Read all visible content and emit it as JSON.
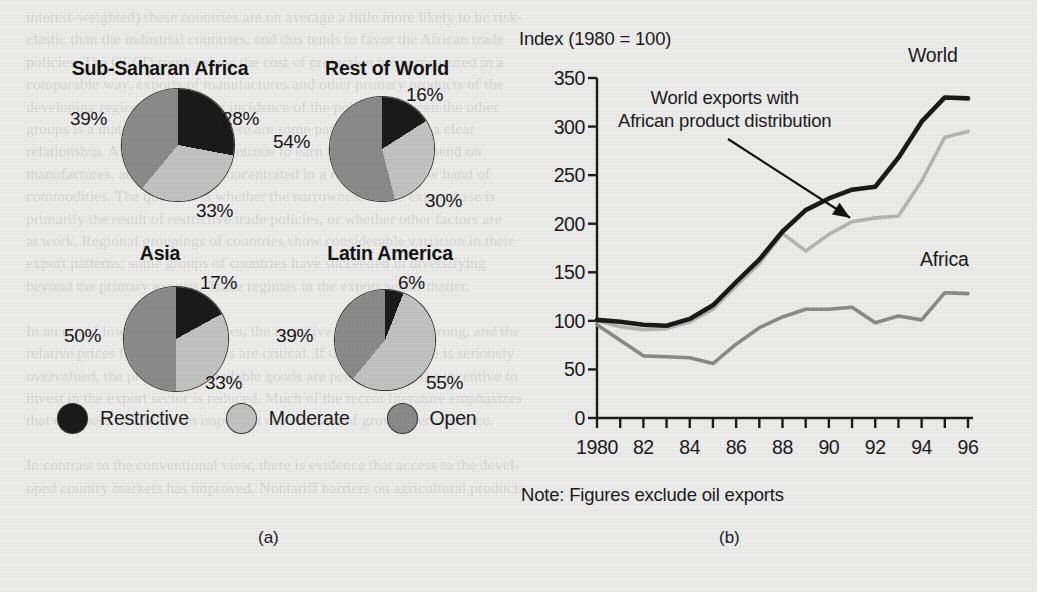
{
  "figure": {
    "panel_a_caption": "(a)",
    "panel_b_caption": "(b)"
  },
  "panel_a": {
    "name": "trade-policy-pie-charts",
    "legend": [
      {
        "label": "Restrictive",
        "color": "#1a1a1a",
        "key": "restrictive"
      },
      {
        "label": "Moderate",
        "color": "#c2c2c2",
        "key": "moderate"
      },
      {
        "label": "Open",
        "color": "#8a8a8a",
        "key": "open"
      }
    ],
    "pies": [
      {
        "title": "Sub-Saharan Africa",
        "slices": [
          {
            "key": "restrictive",
            "label": "28%",
            "value": 28
          },
          {
            "key": "moderate",
            "label": "33%",
            "value": 33
          },
          {
            "key": "open",
            "label": "39%",
            "value": 39
          }
        ]
      },
      {
        "title": "Rest of World",
        "slices": [
          {
            "key": "restrictive",
            "label": "16%",
            "value": 16
          },
          {
            "key": "moderate",
            "label": "30%",
            "value": 30
          },
          {
            "key": "open",
            "label": "54%",
            "value": 54
          }
        ]
      },
      {
        "title": "Asia",
        "slices": [
          {
            "key": "restrictive",
            "label": "17%",
            "value": 17
          },
          {
            "key": "moderate",
            "label": "33%",
            "value": 33
          },
          {
            "key": "open",
            "label": "50%",
            "value": 50
          }
        ]
      },
      {
        "title": "Latin America",
        "slices": [
          {
            "key": "restrictive",
            "label": "6%",
            "value": 6
          },
          {
            "key": "moderate",
            "label": "55%",
            "value": 55
          },
          {
            "key": "open",
            "label": "39%",
            "value": 39
          }
        ]
      }
    ]
  },
  "panel_b": {
    "name": "export-index-line-chart",
    "axis_title": "Index (1980 = 100)",
    "note": "Note: Figures exclude oil exports",
    "annotation": {
      "line1": "World exports with",
      "line2": "African product distribution"
    },
    "series_labels": {
      "world": "World",
      "africa": "Africa"
    }
  },
  "chart_data": {
    "type": "line",
    "title": "Index (1980 = 100)",
    "xlabel": "",
    "ylabel": "Index (1980 = 100)",
    "xlim": [
      1980,
      1996
    ],
    "ylim": [
      0,
      350
    ],
    "yticks": [
      0,
      50,
      100,
      150,
      200,
      250,
      300,
      350
    ],
    "xticks": [
      1980,
      1981,
      1982,
      1983,
      1984,
      1985,
      1986,
      1987,
      1988,
      1989,
      1990,
      1991,
      1992,
      1993,
      1994,
      1995,
      1996
    ],
    "xticklabels": [
      "1980",
      "",
      "82",
      "",
      "84",
      "",
      "86",
      "",
      "88",
      "",
      "90",
      "",
      "92",
      "",
      "94",
      "",
      "96"
    ],
    "grid": false,
    "legend_position": "inline-labels",
    "x": [
      1980,
      1981,
      1982,
      1983,
      1984,
      1985,
      1986,
      1987,
      1988,
      1989,
      1990,
      1991,
      1992,
      1993,
      1994,
      1995,
      1996
    ],
    "series": [
      {
        "name": "World",
        "color": "#1a1a1a",
        "values": [
          101,
          99,
          96,
          95,
          102,
          116,
          140,
          163,
          192,
          214,
          226,
          235,
          238,
          268,
          305,
          330,
          329
        ]
      },
      {
        "name": "World exports with African product distribution",
        "color": "#b4b4b4",
        "values": [
          100,
          94,
          91,
          92,
          99,
          112,
          136,
          159,
          190,
          172,
          189,
          202,
          206,
          208,
          244,
          289,
          295
        ]
      },
      {
        "name": "Africa",
        "color": "#8a8a8a",
        "values": [
          96,
          80,
          64,
          63,
          62,
          56,
          76,
          93,
          104,
          112,
          112,
          114,
          98,
          105,
          101,
          129,
          128
        ]
      }
    ],
    "annotations": [
      {
        "text": "World exports with African product distribution",
        "points_to_series": "World exports with African product distribution",
        "points_to_x": 1991
      },
      {
        "text": "World",
        "series": "World"
      },
      {
        "text": "Africa",
        "series": "Africa"
      }
    ],
    "note": "Note: Figures exclude oil exports"
  },
  "background_text": {
    "lines": [
      "interest-weighted) these countries are on average a little more likely to be risk-",
      "elastic than the industrial countries, and this tends to favor the African trade",
      "policies. The OECD results show the cost of protection being measured in a",
      "comparable way, exports of manufactures and other primary products of the",
      "developing regions; the relative incidence of the policies between the other",
      "groups is a matter of interest. There are some patterns that show a clear",
      "relationship. African countries continue to earn more than they spend on",
      "manufactures, and exports are concentrated in a relatively narrow band of",
      "commodities. The question is whether the narrowness of the export base is",
      "primarily the result of restrictive trade policies, or whether other factors are",
      "at work. Regional groupings of countries show considerable variation in their",
      "export patterns; some groups of countries have succeeded in diversifying",
      "beyond the primary exports. Trade regimes in the export sector matter.",
      "",
      "In an era of low commodity prices, the incentive to diversify is strong, and the",
      "relative prices faced by exporters are critical. If the exchange rate is seriously",
      "overvalued, the producers of tradable goods are penalized and the incentive to",
      "invest in the export sector is reduced. Much of the recent literature emphasizes",
      "that openness to trade is an important determinant of growth performance.",
      "",
      "In contrast to the conventional view, there is evidence that access to the devel-",
      "oped country markets has improved. Nontariff barriers on agricultural products"
    ]
  }
}
